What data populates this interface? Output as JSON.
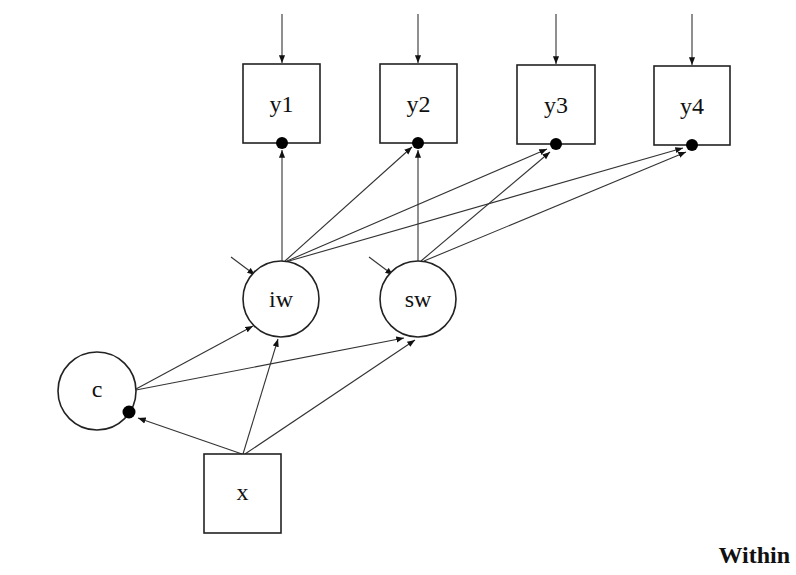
{
  "diagram": {
    "panel_label": "Within",
    "observed": [
      {
        "id": "y1",
        "label": "y1"
      },
      {
        "id": "y2",
        "label": "y2"
      },
      {
        "id": "y3",
        "label": "y3"
      },
      {
        "id": "y4",
        "label": "y4"
      },
      {
        "id": "x",
        "label": "x"
      }
    ],
    "latent": [
      {
        "id": "iw",
        "label": "iw"
      },
      {
        "id": "sw",
        "label": "sw"
      },
      {
        "id": "c",
        "label": "c"
      }
    ],
    "paths": [
      {
        "from": "iw",
        "to": "y1"
      },
      {
        "from": "iw",
        "to": "y2"
      },
      {
        "from": "iw",
        "to": "y3"
      },
      {
        "from": "iw",
        "to": "y4"
      },
      {
        "from": "sw",
        "to": "y2"
      },
      {
        "from": "sw",
        "to": "y3"
      },
      {
        "from": "sw",
        "to": "y4"
      },
      {
        "from": "c",
        "to": "iw"
      },
      {
        "from": "c",
        "to": "sw"
      },
      {
        "from": "x",
        "to": "c"
      },
      {
        "from": "x",
        "to": "iw"
      },
      {
        "from": "x",
        "to": "sw"
      }
    ],
    "random_effect_dots": [
      "y1",
      "y2",
      "y3",
      "y4",
      "c"
    ],
    "residual_arrows": [
      "y1",
      "y2",
      "y3",
      "y4",
      "iw",
      "sw"
    ]
  }
}
